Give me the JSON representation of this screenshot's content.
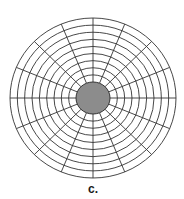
{
  "figure": {
    "label": "c.",
    "center": {
      "x": 93,
      "y": 98
    },
    "outer_radius": {
      "rx": 83,
      "ry": 80
    },
    "inner_ellipse": {
      "rx": 17,
      "ry": 16,
      "fill": "#8c8c8c",
      "stroke": "#333333"
    },
    "ring_count": 9,
    "spoke_count": 16,
    "line_color": "#333333",
    "background": "#ffffff"
  }
}
